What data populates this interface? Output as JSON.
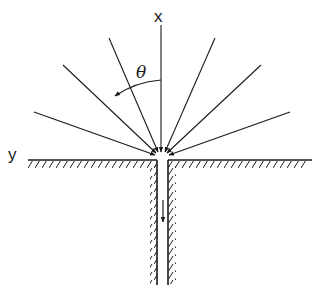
{
  "diagram": {
    "labels": {
      "x_axis": "x",
      "y_axis": "y",
      "angle": "θ"
    },
    "rays": {
      "count_left": 3,
      "count_right": 3,
      "description": "converging streamlines toward slot inlet"
    },
    "colors": {
      "stroke": "#1a1a1a",
      "background": "#ffffff"
    }
  }
}
